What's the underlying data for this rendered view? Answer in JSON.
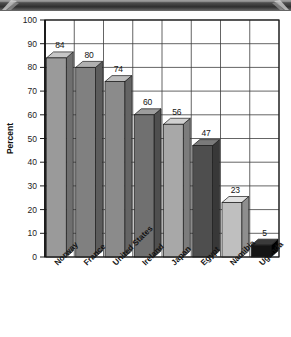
{
  "decor": {
    "top_band_color": "#3a3a3a",
    "arrow_icon_name": "chevron-ornament-icon"
  },
  "chart_data": {
    "type": "bar",
    "title": "",
    "subtitle": "",
    "xlabel": "",
    "ylabel": "Percent",
    "ylim": [
      0,
      100
    ],
    "ytick_step": 10,
    "yticks": [
      "0",
      "10",
      "20",
      "30",
      "40",
      "50",
      "60",
      "70",
      "80",
      "90",
      "100"
    ],
    "grid": true,
    "grid_horizontal": true,
    "grid_vertical": true,
    "legend": "none",
    "three_d": true,
    "categories": [
      "Norway",
      "France",
      "United States",
      "Ireland",
      "Japan",
      "Egypt",
      "Namibia",
      "Uganda"
    ],
    "values": [
      84,
      80,
      74,
      60,
      56,
      47,
      23,
      5
    ],
    "value_labels": [
      "84",
      "80",
      "74",
      "60",
      "56",
      "47",
      "23",
      "5"
    ],
    "bar_colors": [
      "#9a9a9a",
      "#808080",
      "#8b8b8b",
      "#707070",
      "#a8a8a8",
      "#4e4e4e",
      "#bfbfbf",
      "#141414"
    ],
    "bar_top_colors": [
      "#c6c6c6",
      "#b0b0b0",
      "#bcbcbc",
      "#9c9c9c",
      "#d0d0d0",
      "#7a7a7a",
      "#e2e2e2",
      "#3a3a3a"
    ],
    "bar_side_colors": [
      "#6f6f6f",
      "#5c5c5c",
      "#646464",
      "#4f4f4f",
      "#7c7c7c",
      "#383838",
      "#8e8e8e",
      "#000000"
    ]
  }
}
